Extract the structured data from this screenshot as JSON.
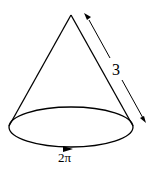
{
  "diagram": {
    "type": "cone",
    "slant_length_label": "3",
    "circumference_label": "2π",
    "stroke_color": "#000000",
    "background": "#ffffff"
  }
}
